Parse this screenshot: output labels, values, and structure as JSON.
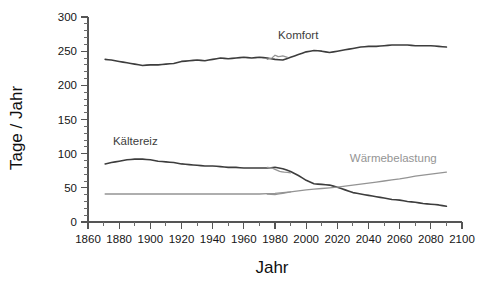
{
  "chart_data": {
    "type": "line",
    "title": "",
    "xlabel": "Jahr",
    "ylabel": "Tage / Jahr",
    "xlim": [
      1860,
      2100
    ],
    "ylim": [
      0,
      300
    ],
    "grid": false,
    "legend_position": "inline-labels",
    "x_ticks_major": [
      1860,
      1880,
      1900,
      1920,
      1940,
      1960,
      1980,
      2000,
      2020,
      2040,
      2060,
      2080,
      2100
    ],
    "x_tick_labels": [
      "1860",
      "1880",
      "1900",
      "1920",
      "1940",
      "1960",
      "1980",
      "2000",
      "2020",
      "2040",
      "2060",
      "2080",
      "2100"
    ],
    "x_minor_step": 10,
    "y_ticks_major": [
      0,
      50,
      100,
      150,
      200,
      250,
      300
    ],
    "y_tick_labels": [
      "0",
      "50",
      "100",
      "150",
      "200",
      "250",
      "300"
    ],
    "y_minor_step": 10,
    "colors": {
      "dark_series": "#3d3d3d",
      "gray_series": "#949494",
      "axis": "#555555",
      "text": "#151515",
      "background": "#ffffff"
    },
    "annotations": [
      {
        "text": "Komfort",
        "x": 1982,
        "y": 268,
        "color": "#3d3d3d"
      },
      {
        "text": "Kältereiz",
        "x": 1876,
        "y": 112,
        "color": "#3d3d3d"
      },
      {
        "text": "Wärmebelastung",
        "x": 2028,
        "y": 88,
        "color": "#949494"
      }
    ],
    "series": [
      {
        "name": "Komfort",
        "color": "#3d3d3d",
        "x": [
          1871,
          1875,
          1880,
          1885,
          1890,
          1895,
          1900,
          1905,
          1910,
          1915,
          1920,
          1925,
          1930,
          1935,
          1940,
          1945,
          1950,
          1955,
          1960,
          1965,
          1970,
          1975,
          1980,
          1985,
          1990,
          1995,
          2000,
          2005,
          2010,
          2015,
          2020,
          2025,
          2030,
          2035,
          2040,
          2045,
          2050,
          2055,
          2060,
          2065,
          2070,
          2075,
          2080,
          2085,
          2090
        ],
        "values": [
          238,
          237,
          235,
          233,
          231,
          229,
          230,
          230,
          231,
          232,
          235,
          236,
          237,
          236,
          238,
          240,
          239,
          240,
          241,
          240,
          241,
          240,
          238,
          237,
          241,
          245,
          249,
          251,
          250,
          248,
          250,
          252,
          254,
          256,
          257,
          257,
          258,
          259,
          259,
          259,
          258,
          258,
          258,
          257,
          256
        ]
      },
      {
        "name": "Komfort (Beobachtung)",
        "color": "#949494",
        "x": [
          1975,
          1978,
          1980,
          1982,
          1985,
          1988
        ],
        "values": [
          238,
          240,
          244,
          242,
          243,
          241
        ]
      },
      {
        "name": "Kältereiz",
        "color": "#3d3d3d",
        "x": [
          1871,
          1875,
          1880,
          1885,
          1890,
          1895,
          1900,
          1905,
          1910,
          1915,
          1920,
          1925,
          1930,
          1935,
          1940,
          1945,
          1950,
          1955,
          1960,
          1965,
          1970,
          1975,
          1980,
          1985,
          1990,
          1995,
          2000,
          2005,
          2010,
          2015,
          2020,
          2025,
          2030,
          2035,
          2040,
          2045,
          2050,
          2055,
          2060,
          2065,
          2070,
          2075,
          2080,
          2085,
          2090
        ],
        "values": [
          85,
          87,
          89,
          91,
          92,
          92,
          91,
          89,
          88,
          87,
          85,
          84,
          83,
          82,
          82,
          81,
          80,
          80,
          79,
          79,
          79,
          79,
          80,
          78,
          74,
          68,
          61,
          56,
          55,
          54,
          51,
          47,
          43,
          41,
          39,
          37,
          35,
          33,
          32,
          30,
          29,
          27,
          26,
          25,
          23
        ]
      },
      {
        "name": "Kältereiz (Beobachtung)",
        "color": "#949494",
        "x": [
          1975,
          1978,
          1980,
          1983,
          1986,
          1990
        ],
        "values": [
          80,
          79,
          77,
          74,
          73,
          72
        ]
      },
      {
        "name": "Wärmebelastung",
        "color": "#949494",
        "x": [
          1871,
          1880,
          1890,
          1900,
          1910,
          1920,
          1930,
          1940,
          1950,
          1960,
          1970,
          1980,
          1990,
          2000,
          2010,
          2020,
          2030,
          2040,
          2050,
          2060,
          2070,
          2080,
          2090
        ],
        "values": [
          41,
          41,
          41,
          41,
          41,
          41,
          41,
          41,
          41,
          41,
          41,
          42,
          44,
          47,
          49,
          51,
          54,
          57,
          60,
          63,
          67,
          70,
          73
        ]
      },
      {
        "name": "Wärmebelastung (Beobachtung)",
        "color": "#949494",
        "x": [
          1975,
          1980,
          1985,
          1990
        ],
        "values": [
          41,
          40,
          42,
          44
        ]
      }
    ]
  }
}
